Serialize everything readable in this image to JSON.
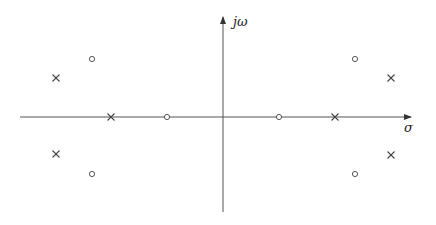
{
  "diagram": {
    "type": "pole-zero-plot",
    "axes": {
      "horizontal_label": "σ",
      "vertical_label": "jω",
      "origin": {
        "x": 223,
        "y": 117
      },
      "h_start": 20,
      "h_end": 411,
      "v_top": 17,
      "v_bottom": 212,
      "color": "#555555"
    },
    "poles": [
      {
        "x": 56,
        "y": 78
      },
      {
        "x": 56,
        "y": 154
      },
      {
        "x": 111,
        "y": 117
      },
      {
        "x": 335,
        "y": 117
      },
      {
        "x": 391,
        "y": 78
      },
      {
        "x": 391,
        "y": 155
      }
    ],
    "zeros": [
      {
        "x": 92,
        "y": 59
      },
      {
        "x": 92,
        "y": 174
      },
      {
        "x": 167,
        "y": 117
      },
      {
        "x": 279,
        "y": 117
      },
      {
        "x": 355,
        "y": 59
      },
      {
        "x": 355,
        "y": 174
      }
    ],
    "legend": {
      "pole_symbol": "×",
      "zero_symbol": "○"
    },
    "marker_color": "#444444"
  }
}
